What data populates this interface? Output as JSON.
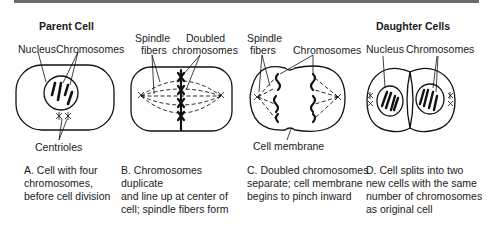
{
  "panels": [
    {
      "id": "A",
      "title": "Parent Cell",
      "labels": [
        "Nucleus",
        "Chromosomes",
        "Centrioles"
      ],
      "caption": [
        "A. Cell with four",
        "chromosomes,",
        "before cell division"
      ]
    },
    {
      "id": "B",
      "title": "",
      "labels": [
        "Spindle",
        "fibers",
        "Doubled",
        "chromosomes"
      ],
      "caption": [
        "B. Chromosomes duplicate",
        "and line up at center of",
        "cell; spindle fibers form"
      ]
    },
    {
      "id": "C",
      "title": "",
      "labels": [
        "Spindle",
        "fibers",
        "Chromosomes",
        "Cell membrane"
      ],
      "caption": [
        "C. Doubled chromosomes",
        "separate; cell membrane",
        "begins to pinch inward"
      ]
    },
    {
      "id": "D",
      "title": "Daughter Cells",
      "labels": [
        "Nucleus",
        "Chromosomes"
      ],
      "caption": [
        "D. Cell splits into two",
        "new cells with the same",
        "number of chromosomes",
        "as original cell"
      ]
    }
  ]
}
